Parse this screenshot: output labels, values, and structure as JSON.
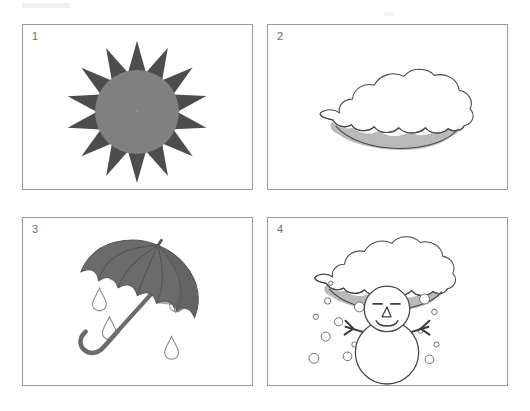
{
  "worksheet": {
    "title": "Weather picture worksheet",
    "background_color": "#ffffff",
    "panel_border_color": "#9a9a9a"
  },
  "panels": [
    {
      "number": "1",
      "subject": "sun",
      "label": "Sunny",
      "icon_name": "sun-icon",
      "colors": {
        "rays": "#4d4d4d",
        "disc": "#808080"
      },
      "ray_count": 14
    },
    {
      "number": "2",
      "subject": "cloud",
      "label": "Cloudy",
      "icon_name": "cloud-icon",
      "colors": {
        "outline": "#4a4a4a",
        "fill": "#ffffff",
        "shadow": "#b8b8b8"
      }
    },
    {
      "number": "3",
      "subject": "umbrella-rain",
      "label": "Rainy",
      "icon_name": "umbrella-icon",
      "colors": {
        "canopy": "#6b6b6b",
        "canopy_dark": "#595959",
        "handle": "#6b6b6b",
        "raindrop_outline": "#8a8a8a"
      },
      "raindrop_count": 7
    },
    {
      "number": "4",
      "subject": "snowman-snow-cloud",
      "label": "Snowy",
      "icon_name": "snowman-icon",
      "colors": {
        "outline": "#4a4a4a",
        "fill": "#ffffff",
        "shadow": "#b8b8b8",
        "snowflake_outline": "#6f6f6f",
        "arms": "#3c3c3c"
      },
      "snowflake_count": 16,
      "face": {
        "eyes": "closed-dashes",
        "nose": "triangle",
        "mouth": "smile"
      }
    }
  ]
}
